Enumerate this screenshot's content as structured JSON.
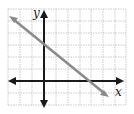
{
  "chart_data": {
    "type": "line",
    "title": "",
    "xlabel": "x",
    "ylabel": "y",
    "grid": true,
    "xlim": [
      -3,
      7
    ],
    "ylim": [
      -2,
      6
    ],
    "series": [
      {
        "name": "line",
        "points": [
          [
            -3,
            5.25
          ],
          [
            0,
            3
          ],
          [
            4,
            0
          ],
          [
            5.5,
            -1.125
          ]
        ],
        "slope": -0.75,
        "y_intercept": 3,
        "x_intercept": 4,
        "color": "#8a8a8a"
      }
    ],
    "axis_color": "#1a1a1a",
    "grid_color": "#b5b5b5"
  }
}
